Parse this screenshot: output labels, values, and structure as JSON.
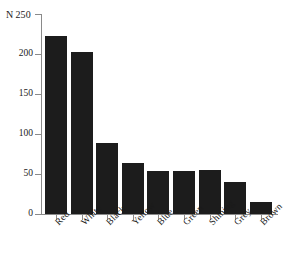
{
  "chart_data": {
    "type": "bar",
    "title": "",
    "xlabel": "",
    "ylabel": "N",
    "categories": [
      "Red",
      "White",
      "Black",
      "Yellow",
      "Blue",
      "Green",
      "Shining",
      "Grey",
      "Brown"
    ],
    "values": [
      222,
      203,
      89,
      64,
      54,
      54,
      55,
      40,
      15
    ],
    "ylim": [
      0,
      250
    ],
    "ytick_labels": [
      "250",
      "200",
      "150",
      "100",
      "50",
      "0"
    ],
    "ytick_values": [
      250,
      200,
      150,
      100,
      50,
      0
    ],
    "grid": false,
    "legend": false,
    "bar_color": "#1c1c1c",
    "axis_color": "#8a8a8a",
    "background": "#ffffff"
  },
  "axis": {
    "y_name": "N",
    "y_top_value": "250"
  }
}
